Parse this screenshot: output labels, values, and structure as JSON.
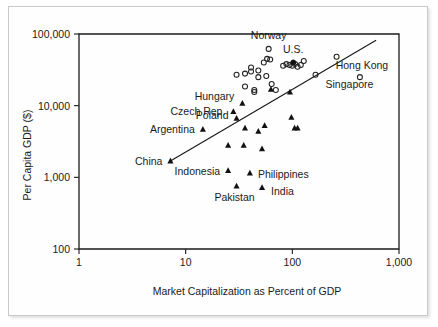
{
  "chart_data": {
    "type": "scatter",
    "title": "",
    "xlabel": "Market Capitalization as Percent of GDP",
    "ylabel": "Per Capita GDP ($)",
    "xscale": "log",
    "yscale": "log",
    "xlim": [
      1,
      1000
    ],
    "ylim": [
      100,
      100000
    ],
    "grid": false,
    "xticks": [
      "1",
      "10",
      "100",
      "1,000"
    ],
    "xtick_values": [
      1,
      10,
      100,
      1000
    ],
    "yticks": [
      "100",
      "1,000",
      "10,000",
      "100,000"
    ],
    "ytick_values": [
      100,
      1000,
      10000,
      100000
    ],
    "legend_position": "below-axes",
    "series": [
      {
        "name": "Developed countries",
        "marker": "open-circle",
        "points": [
          {
            "x": 36,
            "y": 28000,
            "label": ""
          },
          {
            "x": 41,
            "y": 34000,
            "label": ""
          },
          {
            "x": 41,
            "y": 30000,
            "label": ""
          },
          {
            "x": 30,
            "y": 27000,
            "label": ""
          },
          {
            "x": 48,
            "y": 31000,
            "label": ""
          },
          {
            "x": 48,
            "y": 25000,
            "label": ""
          },
          {
            "x": 36,
            "y": 18500,
            "label": ""
          },
          {
            "x": 44,
            "y": 16500,
            "label": ""
          },
          {
            "x": 44,
            "y": 15500,
            "label": ""
          },
          {
            "x": 54,
            "y": 40000,
            "label": ""
          },
          {
            "x": 58,
            "y": 45000,
            "label": ""
          },
          {
            "x": 62,
            "y": 44000,
            "label": ""
          },
          {
            "x": 57,
            "y": 26000,
            "label": ""
          },
          {
            "x": 64,
            "y": 20000,
            "label": ""
          },
          {
            "x": 70,
            "y": 16500,
            "label": ""
          },
          {
            "x": 60,
            "y": 62000,
            "label": "Norway"
          },
          {
            "x": 82,
            "y": 36000,
            "label": ""
          },
          {
            "x": 88,
            "y": 38000,
            "label": ""
          },
          {
            "x": 94,
            "y": 37000,
            "label": ""
          },
          {
            "x": 100,
            "y": 36000,
            "label": ""
          },
          {
            "x": 106,
            "y": 38000,
            "label": ""
          },
          {
            "x": 112,
            "y": 35000,
            "label": ""
          },
          {
            "x": 120,
            "y": 37000,
            "label": ""
          },
          {
            "x": 128,
            "y": 42000,
            "label": ""
          },
          {
            "x": 165,
            "y": 27000,
            "label": "Singapore"
          },
          {
            "x": 260,
            "y": 48000,
            "label": ""
          },
          {
            "x": 430,
            "y": 25000,
            "label": "Hong Kong"
          },
          {
            "x": 102,
            "y": 40000,
            "label": "U.S."
          }
        ]
      },
      {
        "name": "Emerging markets",
        "marker": "filled-triangle",
        "points": [
          {
            "x": 7.2,
            "y": 1700,
            "label": "China"
          },
          {
            "x": 14.5,
            "y": 4700,
            "label": "Argentina"
          },
          {
            "x": 28,
            "y": 8300,
            "label": "Czech Rep."
          },
          {
            "x": 34,
            "y": 10800,
            "label": "Hungary"
          },
          {
            "x": 30,
            "y": 6700,
            "label": "Poland"
          },
          {
            "x": 25,
            "y": 2800,
            "label": ""
          },
          {
            "x": 25,
            "y": 1250,
            "label": "Indonesia"
          },
          {
            "x": 30,
            "y": 760,
            "label": "Pakistan"
          },
          {
            "x": 36,
            "y": 4900,
            "label": ""
          },
          {
            "x": 35,
            "y": 2800,
            "label": ""
          },
          {
            "x": 48,
            "y": 4400,
            "label": ""
          },
          {
            "x": 55,
            "y": 5300,
            "label": ""
          },
          {
            "x": 52,
            "y": 2500,
            "label": ""
          },
          {
            "x": 40,
            "y": 1150,
            "label": "Philippines"
          },
          {
            "x": 52,
            "y": 720,
            "label": "India"
          },
          {
            "x": 63,
            "y": 17000,
            "label": ""
          },
          {
            "x": 98,
            "y": 6900,
            "label": ""
          },
          {
            "x": 105,
            "y": 4900,
            "label": ""
          },
          {
            "x": 112,
            "y": 4900,
            "label": ""
          },
          {
            "x": 95,
            "y": 15500,
            "label": ""
          }
        ]
      }
    ],
    "regression": {
      "name": "Regression line",
      "x0": 7.0,
      "y0": 1650,
      "x1": 610,
      "y1": 82000
    },
    "annotations": [
      {
        "text": "Norway",
        "x": 60,
        "y": 62000
      },
      {
        "text": "U.S.",
        "x": 102,
        "y": 40000
      },
      {
        "text": "Hong Kong",
        "x": 430,
        "y": 25000
      },
      {
        "text": "Singapore",
        "x": 165,
        "y": 27000
      },
      {
        "text": "Hungary",
        "x": 34,
        "y": 10800
      },
      {
        "text": "Czech Rep.",
        "x": 28,
        "y": 8300
      },
      {
        "text": "Poland",
        "x": 30,
        "y": 6700
      },
      {
        "text": "Argentina",
        "x": 14.5,
        "y": 4700
      },
      {
        "text": "China",
        "x": 7.2,
        "y": 1700
      },
      {
        "text": "Indonesia",
        "x": 25,
        "y": 1250
      },
      {
        "text": "Philippines",
        "x": 40,
        "y": 1150
      },
      {
        "text": "Pakistan",
        "x": 30,
        "y": 760
      },
      {
        "text": "India",
        "x": 52,
        "y": 720
      }
    ]
  },
  "axes": {
    "y_title": "Per Capita GDP ($)",
    "x_title": "Market Capitalization as Percent of GDP",
    "y_tick_labels": [
      "100,000",
      "10,000",
      "1,000",
      "100"
    ],
    "x_tick_labels": [
      "1",
      "10",
      "100",
      "1,000"
    ]
  },
  "point_labels": {
    "norway": "Norway",
    "us": "U.S.",
    "hong_kong": "Hong Kong",
    "singapore": "Singapore",
    "hungary": "Hungary",
    "czech": "Czech Rep.",
    "poland": "Poland",
    "argentina": "Argentina",
    "china": "China",
    "indonesia": "Indonesia",
    "philippines": "Philippines",
    "pakistan": "Pakistan",
    "india": "India"
  },
  "legend": {
    "items": [
      {
        "marker": "open-circle",
        "label": "Developed countries"
      },
      {
        "marker": "filled-triangle",
        "label": "Emerging markets"
      },
      {
        "marker": "line",
        "label": "Regression line"
      }
    ]
  },
  "colors": {
    "ink": "#1b1b1b",
    "marker": "#111111",
    "frame": "#c9c9c9",
    "background": "#fefefe"
  }
}
